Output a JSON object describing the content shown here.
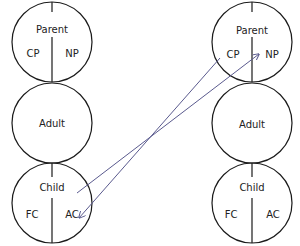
{
  "diagram": {
    "colors": {
      "circle_stroke": "#1a1a1a",
      "arrow": "#5a5a8e",
      "text": "#222222"
    },
    "left_column": {
      "parent": {
        "title": "Parent",
        "left": "CP",
        "right": "NP"
      },
      "adult": {
        "title": "Adult"
      },
      "child": {
        "title": "Child",
        "left": "FC",
        "right": "AC"
      }
    },
    "right_column": {
      "parent": {
        "title": "Parent",
        "left": "CP",
        "right": "NP"
      },
      "adult": {
        "title": "Adult"
      },
      "child": {
        "title": "Child",
        "left": "FC",
        "right": "AC"
      }
    },
    "arrows": [
      {
        "from": "left.child",
        "to": "right.parent.NP"
      },
      {
        "from": "right.parent.CP",
        "to": "left.child.AC"
      }
    ]
  }
}
